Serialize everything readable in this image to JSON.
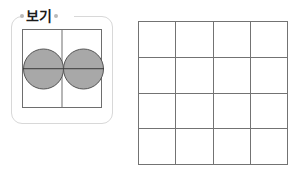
{
  "page": {
    "background_color": "#ffffff",
    "width": 296,
    "height": 174
  },
  "example_box": {
    "label": "보기",
    "label_dots": [
      "dot-left",
      "dot-right"
    ],
    "frame_color": "#d8d8d8",
    "inner_square": {
      "border_color": "#6e6e6e",
      "divider": "vertical",
      "divider_count": 1
    },
    "shapes": [
      {
        "name": "circle-left",
        "type": "circle",
        "fill_color": "#a8a8a8",
        "stroke_color": "#555555",
        "split": "horizontal-half"
      },
      {
        "name": "circle-right",
        "type": "circle",
        "fill_color": "#a8a8a8",
        "stroke_color": "#555555",
        "split": "horizontal-half"
      }
    ],
    "overlay_line": {
      "orientation": "horizontal",
      "color": "#3a3a3a"
    }
  },
  "grid": {
    "rows": 4,
    "columns": 4,
    "line_color": "#737373",
    "fill": "empty",
    "cells": [
      "",
      "",
      "",
      "",
      "",
      "",
      "",
      "",
      "",
      "",
      "",
      "",
      "",
      "",
      "",
      ""
    ]
  }
}
